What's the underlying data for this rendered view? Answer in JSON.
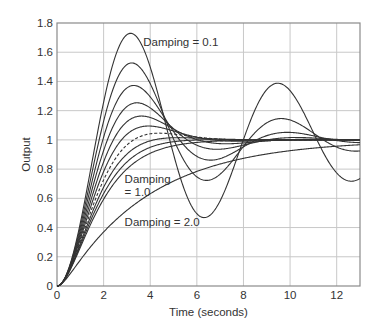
{
  "chart_data": {
    "type": "line",
    "title": "",
    "xlabel": "Time (seconds)",
    "ylabel": "Output",
    "xlim": [
      0,
      13
    ],
    "ylim": [
      0,
      1.8
    ],
    "xticks": [
      0,
      2,
      4,
      6,
      8,
      10,
      12
    ],
    "xtick_labels": [
      "0",
      "2",
      "4",
      "6",
      "8",
      "10",
      "12"
    ],
    "yticks": [
      0,
      0.2,
      0.4,
      0.6,
      0.8,
      1.0,
      1.2,
      1.4,
      1.6,
      1.8
    ],
    "ytick_labels": [
      "0",
      "0.2",
      "0.4",
      "0.6",
      "0.8",
      "1",
      "1.2",
      "1.4",
      "1.6",
      "1.8"
    ],
    "grid": true,
    "legend": "none (inline annotations)",
    "natural_frequency": 1.0,
    "series": [
      {
        "name": "Damping = 0.1",
        "damping": 0.1,
        "style": "solid",
        "peak": {
          "t": 3.16,
          "y": 1.73
        }
      },
      {
        "name": "Damping = 0.2",
        "damping": 0.2,
        "style": "solid",
        "peak": {
          "t": 3.21,
          "y": 1.53
        }
      },
      {
        "name": "Damping = 0.3",
        "damping": 0.3,
        "style": "solid",
        "peak": {
          "t": 3.29,
          "y": 1.37
        }
      },
      {
        "name": "Damping = 0.4",
        "damping": 0.4,
        "style": "solid",
        "peak": {
          "t": 3.43,
          "y": 1.25
        }
      },
      {
        "name": "Damping = 0.5",
        "damping": 0.5,
        "style": "solid",
        "peak": {
          "t": 3.63,
          "y": 1.16
        }
      },
      {
        "name": "Damping = 0.6",
        "damping": 0.6,
        "style": "solid",
        "peak": {
          "t": 3.93,
          "y": 1.09
        }
      },
      {
        "name": "Damping = 0.7",
        "damping": 0.7,
        "style": "dashed",
        "peak": {
          "t": 4.4,
          "y": 1.05
        }
      },
      {
        "name": "Damping = 0.8",
        "damping": 0.8,
        "style": "solid",
        "peak": {
          "t": 5.24,
          "y": 1.02
        }
      },
      {
        "name": "Damping = 0.9",
        "damping": 0.9,
        "style": "solid",
        "peak": {
          "t": 7.21,
          "y": 1.0
        }
      },
      {
        "name": "Damping = 1.0",
        "damping": 1.0,
        "style": "solid"
      },
      {
        "name": "Damping = 2.0",
        "damping": 2.0,
        "style": "solid"
      }
    ],
    "annotations": [
      {
        "text": "Damping = 0.1",
        "x": 3.7,
        "y": 1.67
      },
      {
        "text": "Damping",
        "x": 2.9,
        "y": 0.73
      },
      {
        "text": "= 1.0",
        "x": 2.9,
        "y": 0.64
      },
      {
        "text": "Damping = 2.0",
        "x": 2.9,
        "y": 0.44
      }
    ]
  },
  "colors": {
    "curve": "#333333",
    "grid": "#c8c8c8",
    "frame": "#8a8a8a",
    "text": "#333333"
  }
}
